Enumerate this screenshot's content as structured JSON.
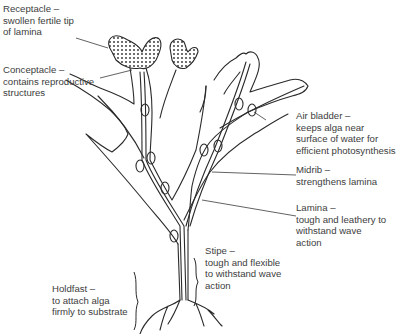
{
  "diagram": {
    "labels": {
      "receptacle": {
        "lines": [
          "Receptacle –",
          "swollen fertile tip",
          "of lamina"
        ]
      },
      "conceptacle": {
        "lines": [
          "Conceptacle –",
          "contains reproductive",
          "structures"
        ]
      },
      "air_bladder": {
        "lines": [
          "Air bladder –",
          "keeps alga near",
          "surface of water for",
          "efficient photosynthesis"
        ]
      },
      "midrib": {
        "lines": [
          "Midrib –",
          "strengthens lamina"
        ]
      },
      "lamina": {
        "lines": [
          "Lamina –",
          "tough and leathery to",
          "withstand wave",
          "action"
        ]
      },
      "stipe": {
        "lines": [
          "Stipe –",
          "tough and flexible",
          "to withstand wave",
          "action"
        ]
      },
      "holdfast": {
        "lines": [
          "Holdfast –",
          "to attach alga",
          "firmly to substrate"
        ]
      }
    },
    "colors": {
      "line": "#2a2a2a",
      "text": "#3d3d3d",
      "background": "#ffffff"
    }
  }
}
